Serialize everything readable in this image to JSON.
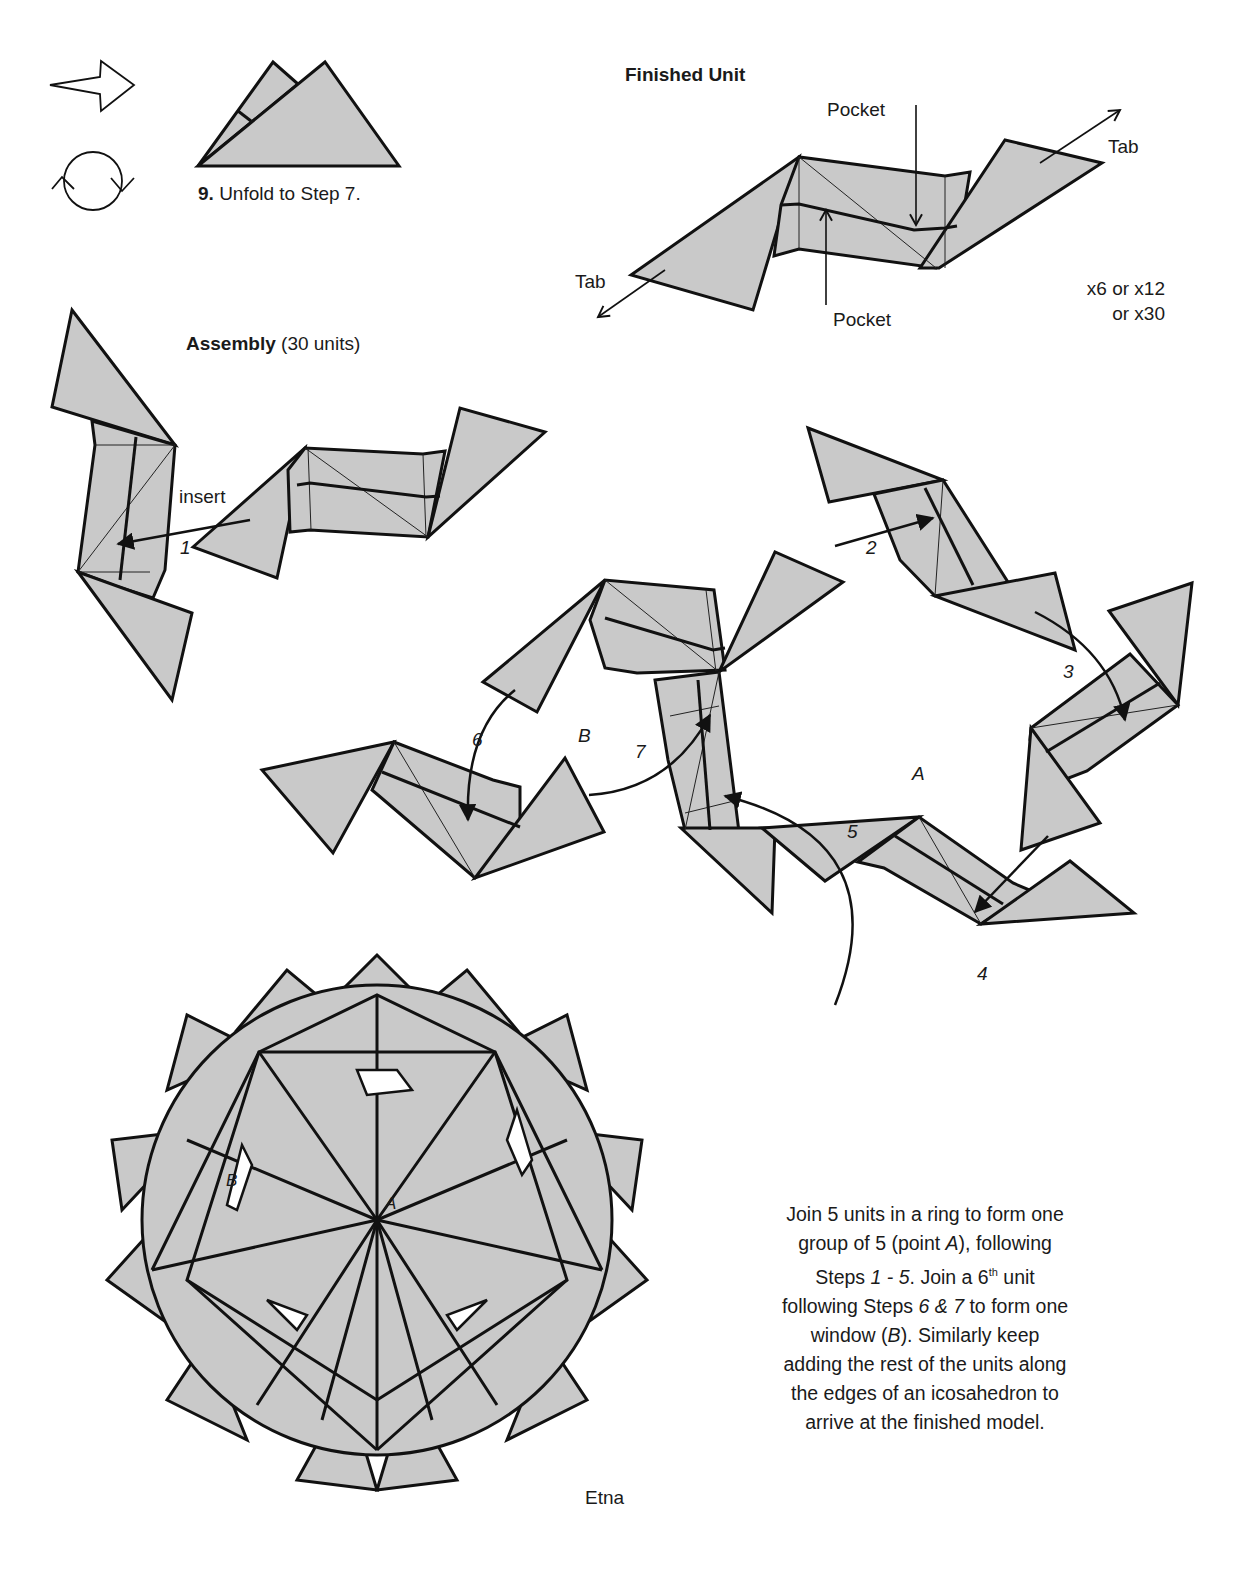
{
  "symbols": {
    "arrow": "hollow-push-arrow",
    "rotate": "turn-over-rotate"
  },
  "step9": {
    "number": "9.",
    "text": "Unfold to Step 7."
  },
  "finished_unit": {
    "title": "Finished Unit",
    "labels": {
      "pocket_top": "Pocket",
      "pocket_bottom": "Pocket",
      "tab_left": "Tab",
      "tab_right": "Tab"
    },
    "multiplier_line1": "x6 or x12",
    "multiplier_line2": "or x30"
  },
  "assembly": {
    "title": "Assembly",
    "subtitle": "(30 units)",
    "insert_label": "insert",
    "steps": [
      "1",
      "2",
      "3",
      "4",
      "5",
      "6",
      "7"
    ],
    "points": {
      "A": "A",
      "B": "B"
    }
  },
  "model": {
    "name": "Etna",
    "points": {
      "A": "A",
      "B": "B"
    }
  },
  "instructions": {
    "l1": "Join 5 units in a ring to form one",
    "l2a": "group of 5 (point ",
    "l2b": "A",
    "l2c": "), following",
    "l3a": "Steps ",
    "l3b": "1 - 5",
    "l3c": ".  Join a 6",
    "l3sup": "th",
    "l3d": " unit",
    "l4a": "following Steps ",
    "l4b": "6 & 7",
    "l4c": " to form one",
    "l5a": "window (",
    "l5b": "B",
    "l5c": "). Similarly keep",
    "l6": "adding the rest of the units along",
    "l7": "the edges of an icosahedron to",
    "l8": "arrive at the finished model."
  },
  "colors": {
    "paper": "#c9c9c9",
    "line": "#111111",
    "background": "#ffffff"
  }
}
